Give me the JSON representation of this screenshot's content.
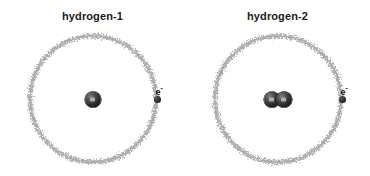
{
  "figure": {
    "background_color": "#ffffff",
    "orbit_color": "#a8a8a8",
    "nucleus_color": "#262626",
    "label_color": "#1b1b1b"
  },
  "atoms": [
    {
      "title": "hydrogen-1",
      "electron_label": "e",
      "electron_charge": "-",
      "nucleus": {
        "proton_count": 1,
        "neutron_count": 0
      }
    },
    {
      "title": "hydrogen-2",
      "electron_label": "e",
      "electron_charge": "-",
      "nucleus": {
        "proton_count": 1,
        "neutron_count": 1
      }
    }
  ]
}
